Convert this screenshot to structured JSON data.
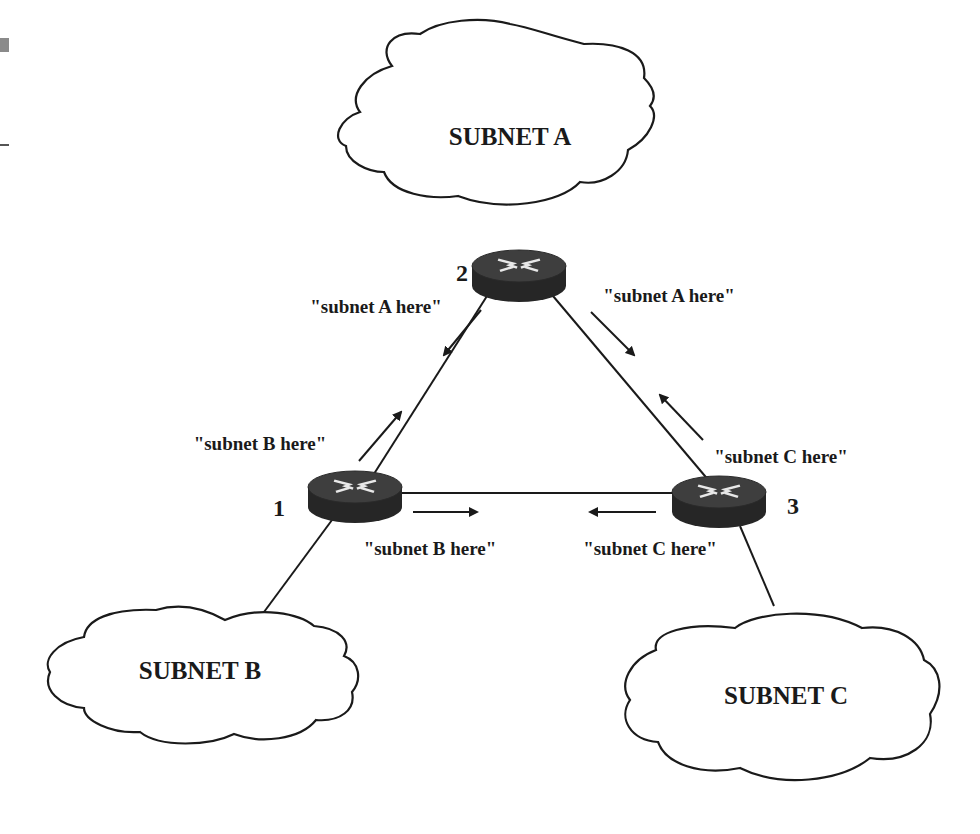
{
  "diagram": {
    "type": "network-topology",
    "subnets": [
      {
        "id": "A",
        "label": "SUBNET A"
      },
      {
        "id": "B",
        "label": "SUBNET B"
      },
      {
        "id": "C",
        "label": "SUBNET C"
      }
    ],
    "routers": [
      {
        "id": "1",
        "label": "1"
      },
      {
        "id": "2",
        "label": "2"
      },
      {
        "id": "3",
        "label": "3"
      }
    ],
    "links": [
      {
        "from": "1",
        "to": "2"
      },
      {
        "from": "2",
        "to": "3"
      },
      {
        "from": "1",
        "to": "3"
      },
      {
        "from": "2",
        "to": "A"
      },
      {
        "from": "1",
        "to": "B"
      },
      {
        "from": "3",
        "to": "C"
      }
    ],
    "advertisements": [
      {
        "from": "2",
        "to": "1",
        "label": "\"subnet A here\""
      },
      {
        "from": "2",
        "to": "3",
        "label": "\"subnet A here\""
      },
      {
        "from": "1",
        "to": "2",
        "label": "\"subnet B here\""
      },
      {
        "from": "1",
        "to": "3",
        "label": "\"subnet B here\""
      },
      {
        "from": "3",
        "to": "2",
        "label": "\"subnet C here\""
      },
      {
        "from": "3",
        "to": "1",
        "label": "\"subnet C here\""
      }
    ]
  },
  "colors": {
    "line": "#1a1a1a",
    "router_top": "#3e3e3e",
    "router_side": "#262626",
    "router_arrows": "#e8e8e8",
    "background": "#ffffff",
    "edge_artifact": "#8a8a8a"
  }
}
